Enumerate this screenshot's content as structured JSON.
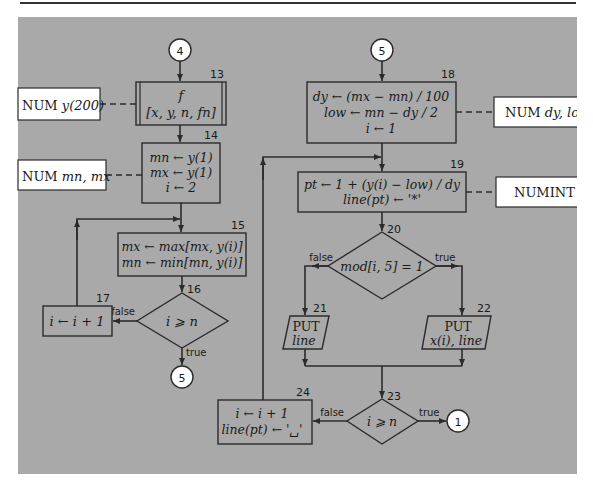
{
  "diagram": {
    "connectors": {
      "c4_in": "4",
      "c5_out": "5",
      "c5_in": "5",
      "c1_out": "1"
    },
    "declarations": {
      "d13": {
        "kw": "NUM",
        "vars": "y(200)"
      },
      "d14": {
        "kw": "NUM",
        "vars": "mn, mx"
      },
      "d18": {
        "kw": "NUM",
        "vars": "dy, low"
      },
      "d19": {
        "kw": "NUMINT",
        "vars": "pt"
      }
    },
    "nodes": {
      "n13": {
        "id": "13",
        "line1": "f",
        "line2": "[x, y, n, fn]"
      },
      "n14": {
        "id": "14",
        "line1": "mn ← y(1)",
        "line2": "mx ← y(1)",
        "line3": "i ← 2"
      },
      "n15": {
        "id": "15",
        "line1": "mx ← max[mx, y(i)]",
        "line2": "mn ← min[mn, y(i)]"
      },
      "n16": {
        "id": "16",
        "cond": "i ⩾ n"
      },
      "n17": {
        "id": "17",
        "line1": "i ← i + 1"
      },
      "n18": {
        "id": "18",
        "line1": "dy ← (mx − mn) / 100",
        "line2": "low ← mn − dy / 2",
        "line3": "i ← 1"
      },
      "n19": {
        "id": "19",
        "line1": "pt ← 1 + (y(i) − low) / dy",
        "line2": "line(pt) ← '*'"
      },
      "n20": {
        "id": "20",
        "cond": "mod[i, 5] = 1"
      },
      "n21": {
        "id": "21",
        "line1": "PUT",
        "line2": "line"
      },
      "n22": {
        "id": "22",
        "line1": "PUT",
        "line2": "x(i), line"
      },
      "n23": {
        "id": "23",
        "cond": "i ⩾ n"
      },
      "n24": {
        "id": "24",
        "line1": "i ← i + 1",
        "line2": "line(pt) ← '␣'"
      }
    },
    "edge_labels": {
      "true": "true",
      "false": "false"
    },
    "colors": {
      "panel": "#a9a9a9",
      "stroke": "#2b2b2b",
      "declaration_fill": "#ffffff",
      "connector_fill": "#ffffff"
    }
  }
}
